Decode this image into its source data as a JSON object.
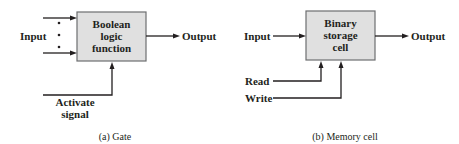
{
  "diagrams": {
    "gate": {
      "block_lines": [
        "Boolean",
        "logic",
        "function"
      ],
      "input_label": "Input",
      "output_label": "Output",
      "control_lines": [
        "Activate",
        "signal"
      ],
      "caption": "(a) Gate",
      "dots": "⋮"
    },
    "memory": {
      "block_lines": [
        "Binary",
        "storage",
        "cell"
      ],
      "input_label": "Input",
      "output_label": "Output",
      "read_label": "Read",
      "write_label": "Write",
      "caption": "(b) Memory cell"
    }
  },
  "colors": {
    "block_fill": "#e0e0e0",
    "block_stroke": "#6d6e70",
    "line": "#231f20"
  }
}
